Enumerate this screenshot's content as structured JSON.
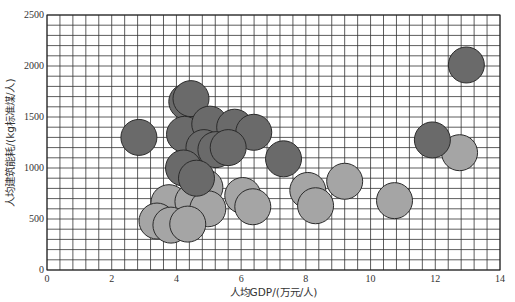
{
  "chart_data": {
    "type": "scatter",
    "subtype": "bubble",
    "title": "",
    "xlabel": "人均GDP/(万元/人)",
    "ylabel": "人均建筑能耗/(kg标准煤/人)",
    "xlim": [
      0,
      14
    ],
    "ylim": [
      0,
      2500
    ],
    "x_ticks": [
      0,
      2,
      4,
      6,
      8,
      10,
      12,
      14
    ],
    "y_ticks": [
      0,
      500,
      1000,
      1500,
      2000,
      2500
    ],
    "grid": true,
    "grid_minor_x_step": 0.4,
    "grid_minor_y_step": 100,
    "legend": null,
    "series": [
      {
        "name": "dark",
        "color": "#6a6a6a",
        "points": [
          {
            "x": 2.84,
            "y": 1300
          },
          {
            "x": 4.32,
            "y": 1650
          },
          {
            "x": 4.45,
            "y": 1680
          },
          {
            "x": 4.25,
            "y": 1330
          },
          {
            "x": 5.03,
            "y": 1430
          },
          {
            "x": 5.8,
            "y": 1400
          },
          {
            "x": 6.39,
            "y": 1350
          },
          {
            "x": 4.85,
            "y": 1200
          },
          {
            "x": 5.22,
            "y": 1180
          },
          {
            "x": 5.6,
            "y": 1200
          },
          {
            "x": 7.31,
            "y": 1090
          },
          {
            "x": 4.22,
            "y": 1000
          },
          {
            "x": 4.62,
            "y": 900
          },
          {
            "x": 11.91,
            "y": 1275
          },
          {
            "x": 12.96,
            "y": 2010
          }
        ]
      },
      {
        "name": "light",
        "color": "#a5a5a5",
        "points": [
          {
            "x": 4.88,
            "y": 810
          },
          {
            "x": 3.77,
            "y": 660
          },
          {
            "x": 4.51,
            "y": 670
          },
          {
            "x": 4.97,
            "y": 600
          },
          {
            "x": 6.05,
            "y": 730
          },
          {
            "x": 6.36,
            "y": 620
          },
          {
            "x": 3.4,
            "y": 480
          },
          {
            "x": 3.83,
            "y": 440
          },
          {
            "x": 4.35,
            "y": 450
          },
          {
            "x": 8.06,
            "y": 780
          },
          {
            "x": 8.3,
            "y": 630
          },
          {
            "x": 9.2,
            "y": 870
          },
          {
            "x": 10.74,
            "y": 680
          },
          {
            "x": 12.75,
            "y": 1150
          }
        ]
      }
    ],
    "bubble_radius_px": 18
  }
}
